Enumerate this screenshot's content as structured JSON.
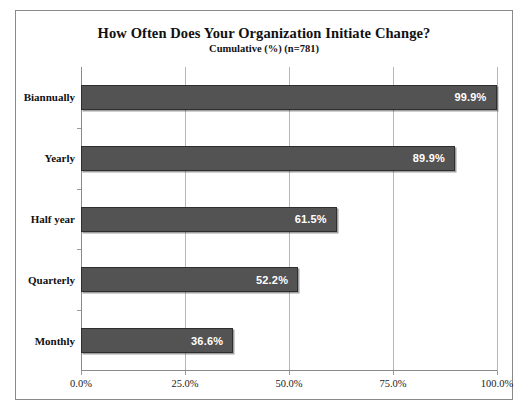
{
  "chart_data": {
    "type": "bar",
    "orientation": "horizontal",
    "title": "How Often Does Your Organization Initiate Change?",
    "subtitle": "Cumulative (%) (n=781)",
    "xlabel": "",
    "ylabel": "",
    "categories": [
      "Biannually",
      "Yearly",
      "Half year",
      "Quarterly",
      "Monthly"
    ],
    "values": [
      99.9,
      89.9,
      61.5,
      52.2,
      36.6
    ],
    "data_labels": [
      "99.9%",
      "89.9%",
      "61.5%",
      "52.2%",
      "36.6%"
    ],
    "xlim": [
      0,
      100
    ],
    "xticks": [
      0,
      25,
      50,
      75,
      100
    ],
    "xtick_labels": [
      "0.0%",
      "25.0%",
      "50.0%",
      "75.0%",
      "100.0%"
    ],
    "grid": true,
    "grid_axis": "x",
    "legend": null,
    "bar_color": "#535353",
    "bar_edge_color": "#2e2e2e",
    "data_label_color": "#ffffff",
    "frame_color": "#8a8a8a",
    "background": "#ffffff"
  }
}
